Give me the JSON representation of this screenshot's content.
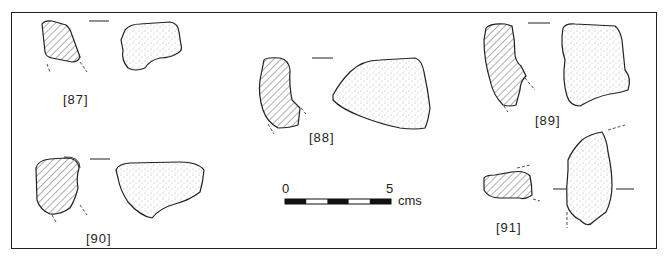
{
  "figure": {
    "labels": [
      {
        "id": "87",
        "text": "[87]"
      },
      {
        "id": "88",
        "text": "[88]"
      },
      {
        "id": "89",
        "text": "[89]"
      },
      {
        "id": "90",
        "text": "[90]"
      },
      {
        "id": "91",
        "text": "[91]"
      }
    ],
    "scale_bar": {
      "start_label": "0",
      "end_label": "5",
      "unit": "cms",
      "segments": 5
    },
    "colors": {
      "ink": "#222222",
      "background": "#ffffff"
    }
  }
}
